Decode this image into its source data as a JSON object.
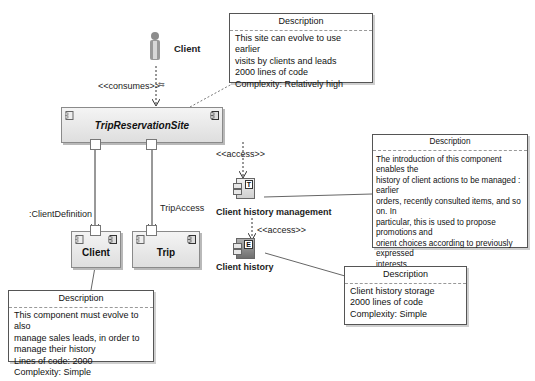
{
  "actor": {
    "name": "Client"
  },
  "relations": {
    "consumes": "<<consumes>>",
    "access_1": "<<access>>",
    "access_2": "<<access>>",
    "client_definition": ":ClientDefinition",
    "trip_access": "TripAccess"
  },
  "components": {
    "site": "TripReservationSite",
    "client": "Client",
    "trip": "Trip",
    "history_mgmt": "Client history management",
    "history": "Client history",
    "history_mgmt_letter": "T",
    "history_letter": "E"
  },
  "notes": {
    "site": {
      "title": "Description",
      "lines": [
        "This site can evolve to use earlier",
        "visits by clients and leads",
        "2000 lines of code",
        "Complexity: Relatively high"
      ]
    },
    "client": {
      "title": "Description",
      "lines": [
        "This component must evolve to also",
        "manage sales leads, in order to",
        "manage their history",
        "Lines of code: 2000",
        "Complexity: Simple"
      ]
    },
    "history_mgmt": {
      "title": "Description",
      "lines": [
        "The introduction of this component enables the",
        "history of client actions to be managed : earlier",
        "orders, recently consulted items, and so on. In",
        "particular, this is used to propose promotions and",
        "orient choices according to previously expressed",
        "interests",
        "5000 lines of code",
        "Complexity: Medium"
      ]
    },
    "history": {
      "title": "Description",
      "lines": [
        "Client history storage",
        "2000 lines of code",
        "Complexity: Simple"
      ]
    }
  }
}
